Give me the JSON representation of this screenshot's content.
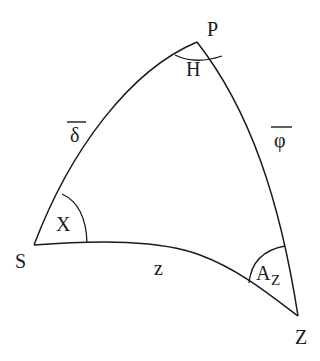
{
  "diagram": {
    "vertices": {
      "P": {
        "label": "P",
        "x": 197,
        "y": 42
      },
      "S": {
        "label": "S",
        "x": 34,
        "y": 245
      },
      "Z": {
        "label": "Z",
        "x": 298,
        "y": 316
      }
    },
    "angles": {
      "at_P": "H",
      "at_S": "X",
      "at_Z": "A",
      "at_Z_subscript": "Z"
    },
    "sides": {
      "PS": {
        "label": "δ",
        "overline": true
      },
      "PZ": {
        "label": "φ",
        "overline": true
      },
      "SZ": {
        "label": "z",
        "overline": false
      }
    },
    "colors": {
      "stroke": "#1a1a1a",
      "background": "#ffffff"
    }
  }
}
